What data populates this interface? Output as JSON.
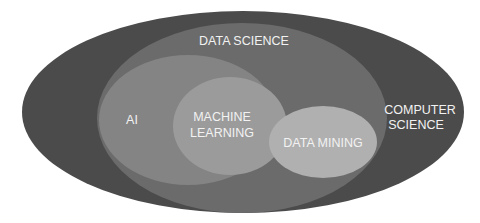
{
  "diagram": {
    "type": "nested-euler",
    "sets": [
      {
        "id": "computer-science",
        "label_lines": [
          "COMPUTER",
          "SCIENCE"
        ],
        "color": "#4b4b4b"
      },
      {
        "id": "data-science",
        "label_lines": [
          "DATA SCIENCE"
        ],
        "color": "#6b6b6b"
      },
      {
        "id": "ai",
        "label_lines": [
          "AI"
        ],
        "color": "#848484"
      },
      {
        "id": "machine-learning",
        "label_lines": [
          "MACHINE",
          "LEARNING"
        ],
        "color": "#9b9b9b"
      },
      {
        "id": "data-mining",
        "label_lines": [
          "DATA MINING"
        ],
        "color": "#b0b0b0"
      }
    ]
  },
  "labels": {
    "computer_science_1": "COMPUTER",
    "computer_science_2": "SCIENCE",
    "data_science": "DATA SCIENCE",
    "ai": "AI",
    "machine_learning_1": "MACHINE",
    "machine_learning_2": "LEARNING",
    "data_mining": "DATA MINING"
  }
}
